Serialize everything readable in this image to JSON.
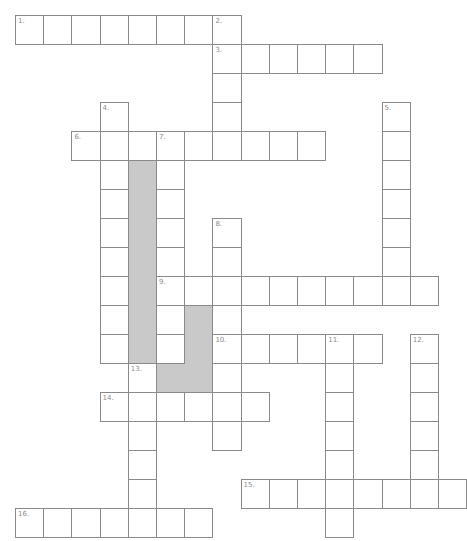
{
  "puzzle": {
    "type": "crossword",
    "grid": {
      "cell_width": 28.2,
      "cell_height": 29,
      "origin_x": 15,
      "origin_y": 15
    },
    "colors": {
      "line": "#8a8a8a",
      "label": "#8c8c8c",
      "shade": "#c9c9c9",
      "background": "#ffffff"
    },
    "entries": [
      {
        "number": "1.",
        "direction": "across",
        "row": 0,
        "col": 0,
        "length": 7
      },
      {
        "number": "2.",
        "direction": "down",
        "row": 0,
        "col": 7,
        "length": 5
      },
      {
        "number": "3.",
        "direction": "across",
        "row": 1,
        "col": 7,
        "length": 6
      },
      {
        "number": "4.",
        "direction": "down",
        "row": 3,
        "col": 3,
        "length": 9
      },
      {
        "number": "5.",
        "direction": "down",
        "row": 3,
        "col": 13,
        "length": 7
      },
      {
        "number": "6.",
        "direction": "across",
        "row": 4,
        "col": 2,
        "length": 9
      },
      {
        "number": "7.",
        "direction": "down",
        "row": 4,
        "col": 5,
        "length": 8
      },
      {
        "number": "8.",
        "direction": "down",
        "row": 7,
        "col": 7,
        "length": 8
      },
      {
        "number": "9.",
        "direction": "across",
        "row": 9,
        "col": 5,
        "length": 10
      },
      {
        "number": "10.",
        "direction": "across",
        "row": 11,
        "col": 7,
        "length": 6
      },
      {
        "number": "11.",
        "direction": "down",
        "row": 11,
        "col": 11,
        "length": 7
      },
      {
        "number": "12.",
        "direction": "down",
        "row": 11,
        "col": 14,
        "length": 6
      },
      {
        "number": "13.",
        "direction": "down",
        "row": 12,
        "col": 4,
        "length": 6
      },
      {
        "number": "14.",
        "direction": "across",
        "row": 13,
        "col": 3,
        "length": 6
      },
      {
        "number": "15.",
        "direction": "across",
        "row": 16,
        "col": 8,
        "length": 8
      },
      {
        "number": "16.",
        "direction": "across",
        "row": 17,
        "col": 0,
        "length": 7
      }
    ],
    "shaded_cells": [
      [
        5,
        4
      ],
      [
        6,
        4
      ],
      [
        7,
        4
      ],
      [
        8,
        4
      ],
      [
        9,
        4
      ],
      [
        10,
        4
      ],
      [
        11,
        4
      ],
      [
        10,
        6
      ],
      [
        11,
        6
      ],
      [
        12,
        5
      ],
      [
        12,
        6
      ]
    ]
  }
}
